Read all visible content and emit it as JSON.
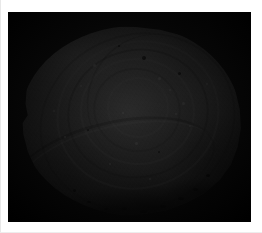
{
  "document": {
    "kind": "photographic-plate",
    "background_color": "#ffffff",
    "width": 262,
    "height": 233
  },
  "photo": {
    "name": "specimen-photograph",
    "caption": "",
    "frame_color": "#050505",
    "frame": {
      "x": 8,
      "y": 12,
      "width": 243,
      "height": 210
    },
    "is_grayscale": true,
    "subject": "rounded laminated specimen"
  },
  "specimen": {
    "name": "specimen",
    "description": "rounded ovoid specimen with concentric whorled laminations",
    "bounds": {
      "x": 20,
      "y": 26,
      "width": 222,
      "height": 190
    },
    "highlight_color": "#cdcdcd",
    "midtone_color": "#8c8c8c",
    "shadow_color": "#3a3a3a",
    "rim_color": "#0a0a0a",
    "features": {
      "whorl_rings": 6,
      "cleft_count": 3,
      "pit_count": 6,
      "fleck_count": 14
    },
    "pits": [
      {
        "left": 55,
        "top": 16,
        "size": 4
      },
      {
        "left": 71,
        "top": 24,
        "size": 3
      },
      {
        "left": 44,
        "top": 10,
        "size": 2
      },
      {
        "left": 30,
        "top": 54,
        "size": 2
      },
      {
        "left": 62,
        "top": 66,
        "size": 2
      },
      {
        "left": 24,
        "top": 86,
        "size": 3
      }
    ],
    "flecks": [
      {
        "left": 62,
        "top": 27,
        "size": 3
      },
      {
        "left": 67,
        "top": 33,
        "size": 2
      },
      {
        "left": 73,
        "top": 40,
        "size": 3
      },
      {
        "left": 70,
        "top": 46,
        "size": 2
      },
      {
        "left": 76,
        "top": 52,
        "size": 2
      },
      {
        "left": 33,
        "top": 20,
        "size": 3
      },
      {
        "left": 27,
        "top": 31,
        "size": 2
      },
      {
        "left": 46,
        "top": 45,
        "size": 2
      },
      {
        "left": 52,
        "top": 61,
        "size": 3
      },
      {
        "left": 40,
        "top": 72,
        "size": 2
      },
      {
        "left": 58,
        "top": 80,
        "size": 2
      },
      {
        "left": 20,
        "top": 58,
        "size": 2
      },
      {
        "left": 84,
        "top": 30,
        "size": 2
      },
      {
        "left": 15,
        "top": 44,
        "size": 2
      }
    ],
    "crust_specks": [
      {
        "left": 46,
        "top": 95,
        "w": 5,
        "h": 3
      },
      {
        "left": 54,
        "top": 97,
        "w": 7,
        "h": 3
      },
      {
        "left": 63,
        "top": 94,
        "w": 6,
        "h": 3
      },
      {
        "left": 71,
        "top": 90,
        "w": 6,
        "h": 3
      },
      {
        "left": 78,
        "top": 85,
        "w": 5,
        "h": 3
      },
      {
        "left": 38,
        "top": 96,
        "w": 4,
        "h": 2
      },
      {
        "left": 30,
        "top": 92,
        "w": 4,
        "h": 2
      },
      {
        "left": 84,
        "top": 78,
        "w": 4,
        "h": 3
      },
      {
        "left": 66,
        "top": 98,
        "w": 4,
        "h": 2
      }
    ]
  }
}
